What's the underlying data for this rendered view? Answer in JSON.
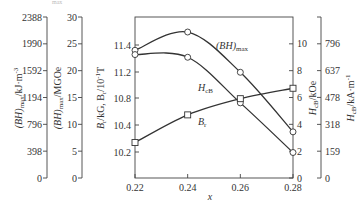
{
  "chart_data": {
    "type": "line",
    "title": "",
    "xlabel": "x",
    "x": [
      0.22,
      0.24,
      0.26,
      0.28
    ],
    "x_tick_labels": [
      "0.22",
      "0.24",
      "0.26",
      "0.28"
    ],
    "series": [
      {
        "name": "(BH)max",
        "axis": "BHmax MGOe (left)",
        "marker": "circle",
        "values": [
          23.8,
          27.2,
          19.7,
          8.6
        ]
      },
      {
        "name": "HcB",
        "axis": "HcB kOe (right)",
        "marker": "circle",
        "values": [
          9.2,
          9.0,
          5.6,
          1.9
        ]
      },
      {
        "name": "Br",
        "axis": "Br kG (inner left)",
        "marker": "square",
        "values": [
          10.27,
          10.55,
          10.79,
          10.95
        ]
      }
    ],
    "axes": {
      "bh_kj": {
        "label": "(BH)max/kJ·m⁻³",
        "ticks": [
          "2388",
          "1990",
          "1592",
          "1194",
          "796",
          "398",
          "0"
        ],
        "range": [
          0,
          2388
        ]
      },
      "bh_mgoe": {
        "label": "(BH)max/MGOe",
        "ticks": [
          "30",
          "25",
          "20",
          "15",
          "10",
          "5",
          "0"
        ],
        "range": [
          0,
          30
        ]
      },
      "br": {
        "label": "Br/kG, Br/10⁻¹T",
        "ticks": [
          "11.4",
          "11.2",
          "10.8",
          "10.4",
          "10.2"
        ]
      },
      "hcb_koe": {
        "label": "HcB/kOe",
        "ticks": [
          "10",
          "8",
          "6",
          "4",
          "2",
          "0"
        ],
        "range": [
          0,
          12
        ]
      },
      "hcb_ka": {
        "label": "HcB/kA·m⁻¹",
        "ticks": [
          "796",
          "637",
          "478",
          "318",
          "159",
          "0"
        ],
        "range": [
          0,
          955
        ]
      }
    },
    "annotations": [
      "(BH)max",
      "HcB",
      "Br"
    ],
    "grid": false,
    "legend": "inline labels"
  },
  "labels": {
    "curve_bh": "(BH)",
    "curve_bh_sub": "max",
    "curve_hcb": "H",
    "curve_hcb_sub": "cB",
    "curve_br": "B",
    "curve_br_sub": "r",
    "x_axis": "x",
    "bh_kj_a": "(BH)",
    "bh_kj_sub": "max",
    "bh_kj_b": "/kJ·m",
    "bh_kj_exp": "-3",
    "bh_mgoe_a": "(BH)",
    "bh_mgoe_sub": "max",
    "bh_mgoe_b": "/MGOe",
    "br_a": "B",
    "br_sub1": "r",
    "br_b": "/kG, B",
    "br_sub2": "r",
    "br_c": "/10",
    "br_exp": "-1",
    "br_d": "T",
    "hcb_koe_a": "H",
    "hcb_koe_sub": "cB",
    "hcb_koe_b": "/kOe",
    "hcb_ka_a": "H",
    "hcb_ka_sub": "cB",
    "hcb_ka_b": "/kA·m",
    "hcb_ka_exp": "-1",
    "stray_top": "max"
  }
}
